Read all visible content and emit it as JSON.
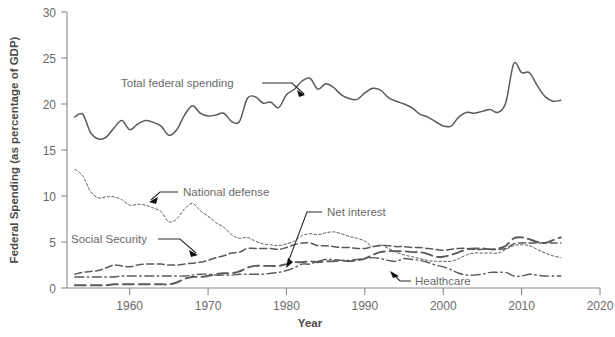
{
  "chart_data": {
    "type": "line",
    "title": "",
    "xlabel": "Year",
    "ylabel": "Federal Spending (as percentage of GDP)",
    "xlim": [
      1952,
      2020
    ],
    "ylim": [
      0,
      30
    ],
    "xticks": [
      1960,
      1970,
      1980,
      1990,
      2000,
      2010,
      2020
    ],
    "yticks": [
      0,
      5,
      10,
      15,
      20,
      25,
      30
    ],
    "grid": false,
    "legend": "inline-annotations",
    "x": [
      1953,
      1954,
      1955,
      1956,
      1957,
      1958,
      1959,
      1960,
      1961,
      1962,
      1963,
      1964,
      1965,
      1966,
      1967,
      1968,
      1969,
      1970,
      1971,
      1972,
      1973,
      1974,
      1975,
      1976,
      1977,
      1978,
      1979,
      1980,
      1981,
      1982,
      1983,
      1984,
      1985,
      1986,
      1987,
      1988,
      1989,
      1990,
      1991,
      1992,
      1993,
      1994,
      1995,
      1996,
      1997,
      1998,
      1999,
      2000,
      2001,
      2002,
      2003,
      2004,
      2005,
      2006,
      2007,
      2008,
      2009,
      2010,
      2011,
      2012,
      2013,
      2014,
      2015
    ],
    "series": [
      {
        "name": "Total federal spending",
        "style": "solid",
        "values": [
          18.6,
          18.9,
          16.9,
          16.2,
          16.4,
          17.4,
          18.2,
          17.2,
          17.8,
          18.2,
          18.0,
          17.6,
          16.6,
          17.2,
          18.8,
          19.8,
          19.0,
          18.7,
          18.8,
          19.0,
          18.1,
          18.1,
          20.6,
          20.8,
          20.1,
          20.2,
          19.6,
          21.0,
          21.6,
          22.5,
          22.8,
          21.6,
          22.2,
          21.8,
          21.0,
          20.6,
          20.5,
          21.2,
          21.7,
          21.5,
          20.7,
          20.3,
          20.0,
          19.6,
          18.9,
          18.6,
          18.1,
          17.6,
          17.6,
          18.6,
          19.1,
          19.0,
          19.2,
          19.4,
          19.1,
          20.2,
          24.4,
          23.4,
          23.4,
          22.0,
          20.8,
          20.3,
          20.4
        ]
      },
      {
        "name": "National defense",
        "style": "fine-dotted",
        "values": [
          12.9,
          12.2,
          10.5,
          9.8,
          9.9,
          9.9,
          9.6,
          9.0,
          9.1,
          9.0,
          8.7,
          8.3,
          7.2,
          7.5,
          8.6,
          9.2,
          8.4,
          7.8,
          7.1,
          6.6,
          5.8,
          5.4,
          5.5,
          5.1,
          4.8,
          4.7,
          4.6,
          4.8,
          5.1,
          5.7,
          5.9,
          5.8,
          6.0,
          6.1,
          5.9,
          5.6,
          5.4,
          5.1,
          4.5,
          4.7,
          4.3,
          3.9,
          3.6,
          3.4,
          3.2,
          3.0,
          2.9,
          2.9,
          2.9,
          3.2,
          3.6,
          3.8,
          3.8,
          3.8,
          3.8,
          4.2,
          4.6,
          4.7,
          4.6,
          4.2,
          3.8,
          3.5,
          3.3
        ]
      },
      {
        "name": "Social Security",
        "style": "dashed",
        "values": [
          1.5,
          1.7,
          1.8,
          1.9,
          2.2,
          2.5,
          2.4,
          2.3,
          2.5,
          2.6,
          2.6,
          2.6,
          2.5,
          2.5,
          2.6,
          2.7,
          2.8,
          3.0,
          3.3,
          3.5,
          3.8,
          3.9,
          4.3,
          4.3,
          4.3,
          4.3,
          4.2,
          4.4,
          4.7,
          4.9,
          4.9,
          4.6,
          4.6,
          4.5,
          4.4,
          4.4,
          4.3,
          4.3,
          4.5,
          4.6,
          4.6,
          4.5,
          4.5,
          4.4,
          4.4,
          4.3,
          4.2,
          4.1,
          4.2,
          4.3,
          4.3,
          4.2,
          4.2,
          4.2,
          4.2,
          4.3,
          4.8,
          4.9,
          4.9,
          4.9,
          4.9,
          4.9,
          4.9
        ]
      },
      {
        "name": "Healthcare",
        "style": "long-dashed",
        "values": [
          0.3,
          0.3,
          0.3,
          0.3,
          0.3,
          0.4,
          0.4,
          0.4,
          0.4,
          0.4,
          0.4,
          0.4,
          0.4,
          0.6,
          1.0,
          1.2,
          1.2,
          1.3,
          1.5,
          1.6,
          1.6,
          1.8,
          2.2,
          2.4,
          2.4,
          2.4,
          2.4,
          2.6,
          2.8,
          2.8,
          2.9,
          2.8,
          2.9,
          2.9,
          3.0,
          2.9,
          3.0,
          3.2,
          3.6,
          3.9,
          4.0,
          4.0,
          4.0,
          3.9,
          3.9,
          3.7,
          3.4,
          3.4,
          3.6,
          3.9,
          4.2,
          4.3,
          4.3,
          4.2,
          4.3,
          4.6,
          5.4,
          5.5,
          5.3,
          5.0,
          4.9,
          5.2,
          5.5
        ]
      },
      {
        "name": "Net interest",
        "style": "dash-dot",
        "values": [
          1.2,
          1.2,
          1.2,
          1.2,
          1.2,
          1.2,
          1.3,
          1.3,
          1.3,
          1.3,
          1.3,
          1.3,
          1.3,
          1.3,
          1.3,
          1.4,
          1.5,
          1.5,
          1.4,
          1.4,
          1.4,
          1.5,
          1.5,
          1.5,
          1.5,
          1.6,
          1.7,
          1.9,
          2.2,
          2.6,
          2.6,
          2.9,
          3.1,
          3.1,
          3.0,
          3.0,
          3.1,
          3.2,
          3.3,
          3.2,
          3.0,
          2.9,
          3.2,
          3.1,
          3.0,
          2.8,
          2.5,
          2.3,
          2.0,
          1.6,
          1.4,
          1.4,
          1.5,
          1.7,
          1.7,
          1.7,
          1.3,
          1.3,
          1.5,
          1.4,
          1.3,
          1.3,
          1.3
        ]
      }
    ],
    "annotations": [
      {
        "text": "Total federal spending",
        "points_to": "total-series"
      },
      {
        "text": "National defense",
        "points_to": "defense-series"
      },
      {
        "text": "Social Security",
        "points_to": "social-security-series"
      },
      {
        "text": "Net interest",
        "points_to": "net-interest-series"
      },
      {
        "text": "Healthcare",
        "points_to": "healthcare-series"
      }
    ],
    "colors": {
      "line": "#5a5a5a",
      "axis": "#8a8a8a",
      "text": "#6a6a6a",
      "annotation_leader": "#222222"
    }
  },
  "labels": {
    "y_axis_title": "Federal Spending (as percentage of GDP)",
    "x_axis_title": "Year",
    "yticks": [
      "0",
      "5",
      "10",
      "15",
      "20",
      "25",
      "30"
    ],
    "xticks": [
      "1960",
      "1970",
      "1980",
      "1990",
      "2000",
      "2010",
      "2020"
    ],
    "ann_total": "Total federal spending",
    "ann_defense": "National defense",
    "ann_social": "Social Security",
    "ann_interest": "Net interest",
    "ann_health": "Healthcare"
  }
}
